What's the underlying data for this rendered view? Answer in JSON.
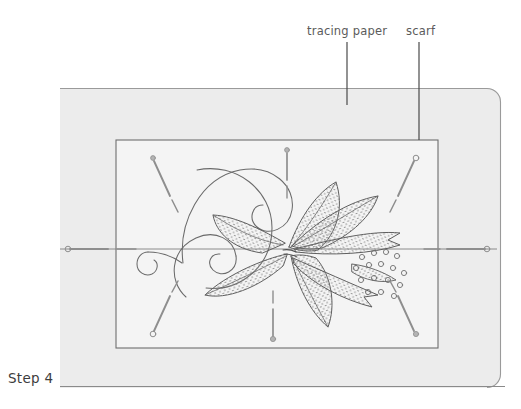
{
  "illustration": {
    "title_label": "Step 4",
    "annotations": [
      {
        "id": "tracing-paper",
        "label": "tracing paper",
        "leader_x": 347,
        "leader_y1": 42,
        "leader_y2": 105
      },
      {
        "id": "scarf",
        "label": "scarf",
        "leader_x": 419,
        "leader_y1": 42,
        "leader_y2": 140
      }
    ],
    "colors": {
      "scarf_fill": "#ececec",
      "scarf_stroke": "#9a9a9a",
      "paper_fill": "#f4f4f4",
      "paper_stroke": "#6e6e6e",
      "design_stroke": "#6a6a6a",
      "pin_color": "#8e8e8e",
      "label_text": "#5b5b5b",
      "step_text": "#3d3d3d",
      "baseline": "#8a8a8a"
    },
    "scarf": {
      "x": 60,
      "y": 88,
      "width": 441,
      "height": 300,
      "corner_radius": 14
    },
    "tracing_paper": {
      "x": 116,
      "y": 140,
      "width": 322,
      "height": 208
    },
    "center_line": {
      "x1": 60,
      "y1": 249,
      "x2": 497,
      "y2": 249
    },
    "pins": [
      {
        "id": "pin-top-left-diagonal",
        "x1": 152,
        "y1": 157,
        "x2": 174,
        "y2": 205,
        "head": "top"
      },
      {
        "id": "pin-top-center-vertical",
        "x1": 287,
        "y1": 150,
        "x2": 287,
        "y2": 196,
        "head": "top"
      },
      {
        "id": "pin-top-right-diagonal",
        "x1": 416,
        "y1": 157,
        "x2": 392,
        "y2": 205,
        "head": "top"
      },
      {
        "id": "pin-left-horizontal",
        "x1": 66,
        "y1": 249,
        "x2": 128,
        "y2": 249,
        "head": "left"
      },
      {
        "id": "pin-right-horizontal",
        "x1": 487,
        "y1": 249,
        "x2": 428,
        "y2": 249,
        "head": "right"
      },
      {
        "id": "pin-bottom-left-diagonal",
        "x1": 152,
        "y1": 334,
        "x2": 174,
        "y2": 288,
        "head": "bottom"
      },
      {
        "id": "pin-bottom-center-vertical",
        "x1": 273,
        "y1": 339,
        "x2": 273,
        "y2": 292,
        "head": "bottom"
      },
      {
        "id": "pin-bottom-right-diagonal",
        "x1": 416,
        "y1": 334,
        "x2": 392,
        "y2": 288,
        "head": "bottom"
      }
    ],
    "design": {
      "name": "floral-embroidery-motif",
      "elements": [
        "large-scroll",
        "small-scroll",
        "petal-leaves",
        "stippled-fill",
        "circle-cluster"
      ]
    },
    "baseline": {
      "x1": 60,
      "y1": 386,
      "x2": 505,
      "y2": 386
    }
  }
}
